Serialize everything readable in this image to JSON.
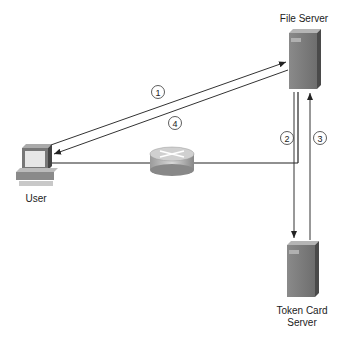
{
  "diagram": {
    "nodes": {
      "file_server": {
        "label": "File Server",
        "icon": "server-icon"
      },
      "user": {
        "label": "User",
        "icon": "workstation-icon"
      },
      "router": {
        "label": "",
        "icon": "router-icon"
      },
      "token_server": {
        "label_line1": "Token Card",
        "label_line2": "Server",
        "icon": "server-icon"
      }
    },
    "steps": {
      "s1": "1",
      "s2": "2",
      "s3": "3",
      "s4": "4"
    },
    "edges": [
      {
        "from": "user",
        "to": "file_server",
        "step": "1"
      },
      {
        "from": "file_server",
        "to": "token_server",
        "step": "2"
      },
      {
        "from": "token_server",
        "to": "file_server",
        "step": "3"
      },
      {
        "from": "file_server",
        "to": "user",
        "step": "4"
      }
    ]
  }
}
